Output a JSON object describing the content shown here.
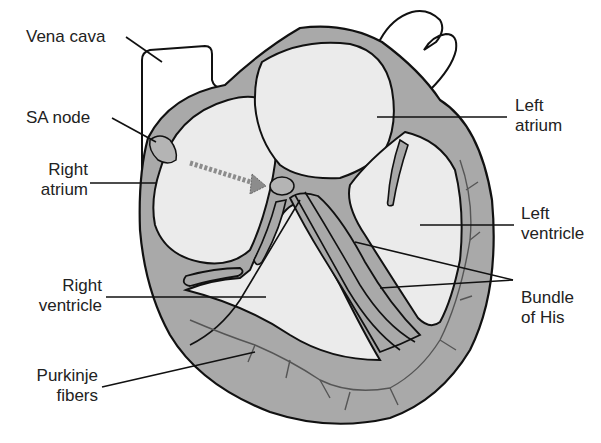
{
  "diagram": {
    "colors": {
      "background": "#ffffff",
      "wall": "#a9a9a9",
      "chamber": "#ebebeb",
      "node": "#b4b4b4",
      "outline": "#111111",
      "arrow": "#8c8c8c",
      "text": "#222222"
    },
    "labels": {
      "vena_cava": {
        "line1": "Vena cava"
      },
      "sa_node": {
        "line1": "SA node"
      },
      "right_atrium": {
        "line1": "Right",
        "line2": "atrium"
      },
      "right_ventricle": {
        "line1": "Right",
        "line2": "ventricle"
      },
      "purkinje_fibers": {
        "line1": "Purkinje",
        "line2": "fibers"
      },
      "left_atrium": {
        "line1": "Left",
        "line2": "atrium"
      },
      "left_ventricle": {
        "line1": "Left",
        "line2": "ventricle"
      },
      "bundle_of_his": {
        "line1": "Bundle",
        "line2": "of His"
      }
    },
    "arrow": {
      "from": "SA node",
      "to": "AV node",
      "style": "dashed"
    }
  }
}
